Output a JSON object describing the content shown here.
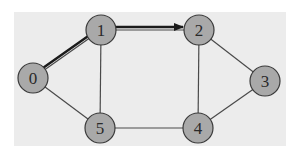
{
  "diagram": {
    "type": "graph",
    "colors": {
      "background": "#ffffff",
      "panel": "#ececec",
      "node_fill": "#a9a9a9",
      "node_stroke": "#3a3a3a",
      "edge": "#4a4a4a",
      "path": "#1a1a1a"
    },
    "nodes": [
      {
        "id": "0",
        "label": "0",
        "x": 33,
        "y": 78
      },
      {
        "id": "1",
        "label": "1",
        "x": 101,
        "y": 30
      },
      {
        "id": "2",
        "label": "2",
        "x": 199,
        "y": 30
      },
      {
        "id": "3",
        "label": "3",
        "x": 265,
        "y": 81
      },
      {
        "id": "4",
        "label": "4",
        "x": 198,
        "y": 128
      },
      {
        "id": "5",
        "label": "5",
        "x": 100,
        "y": 128
      }
    ],
    "edges": [
      {
        "from": "0",
        "to": "1",
        "highlighted": true
      },
      {
        "from": "1",
        "to": "2",
        "highlighted": true
      },
      {
        "from": "0",
        "to": "5",
        "highlighted": false
      },
      {
        "from": "1",
        "to": "5",
        "highlighted": false
      },
      {
        "from": "5",
        "to": "4",
        "highlighted": false
      },
      {
        "from": "2",
        "to": "4",
        "highlighted": false
      },
      {
        "from": "2",
        "to": "3",
        "highlighted": false
      },
      {
        "from": "3",
        "to": "4",
        "highlighted": false
      }
    ],
    "path": {
      "nodes": [
        "0",
        "1",
        "2"
      ],
      "directed": true,
      "arrow_at": "2"
    }
  }
}
